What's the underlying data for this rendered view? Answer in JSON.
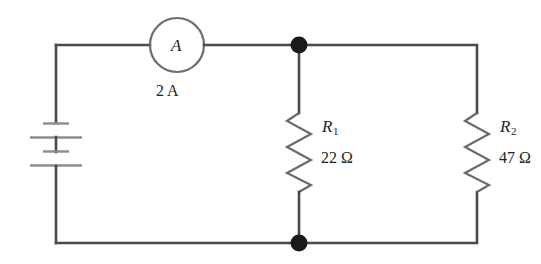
{
  "diagram": {
    "type": "electrical-circuit-schematic",
    "stroke_color": "#4a4a4a",
    "node_color": "#1a1a1a",
    "background": "#ffffff"
  },
  "ammeter": {
    "symbol_label": "A",
    "reading": "2 A",
    "name": "ammeter"
  },
  "battery": {
    "name": "battery",
    "cells": 2,
    "plates": [
      "short",
      "long",
      "short",
      "long"
    ]
  },
  "resistors": [
    {
      "id": "R1",
      "name_main": "R",
      "name_sub": "1",
      "value": "22 Ω"
    },
    {
      "id": "R2",
      "name_main": "R",
      "name_sub": "2",
      "value": "47 Ω"
    }
  ],
  "nodes": [
    {
      "name": "top-junction"
    },
    {
      "name": "bottom-junction"
    }
  ]
}
